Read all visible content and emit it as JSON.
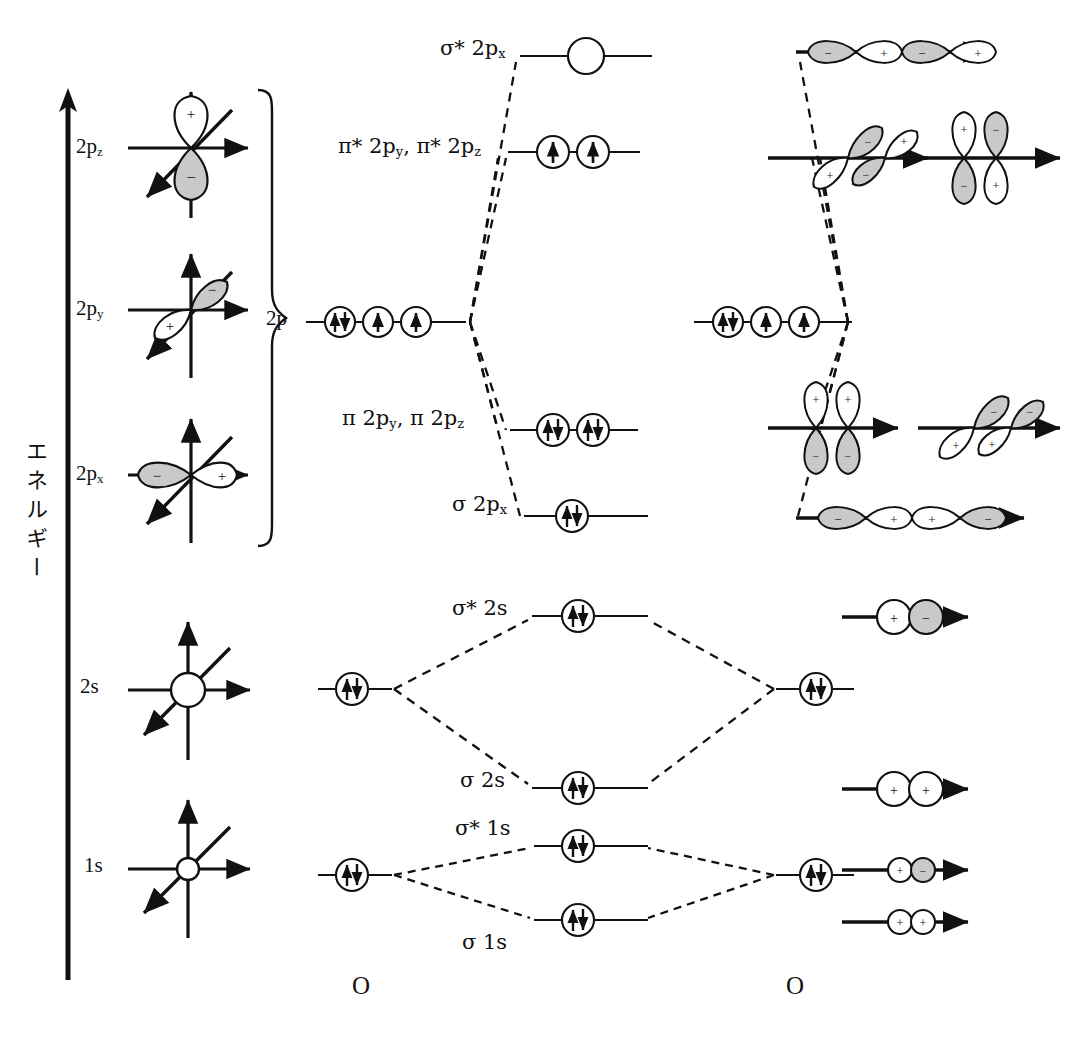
{
  "diagram": {
    "title_axis": "エネルギー",
    "molecule": "O2",
    "atom_left_label": "O",
    "atom_right_label": "O"
  },
  "atomic_orbitals": [
    {
      "name": "2p-z-orbital",
      "label_main": "2p",
      "label_sub": "z",
      "lobes": [
        {
          "sign": "+",
          "shade": "white"
        },
        {
          "sign": "-",
          "shade": "gray"
        }
      ],
      "orientation": "vertical"
    },
    {
      "name": "2p-y-orbital",
      "label_main": "2p",
      "label_sub": "y",
      "lobes": [
        {
          "sign": "-",
          "shade": "gray"
        },
        {
          "sign": "+",
          "shade": "white"
        }
      ],
      "orientation": "diagonal"
    },
    {
      "name": "2p-x-orbital",
      "label_main": "2p",
      "label_sub": "x",
      "lobes": [
        {
          "sign": "-",
          "shade": "gray"
        },
        {
          "sign": "+",
          "shade": "white"
        }
      ],
      "orientation": "horizontal"
    },
    {
      "name": "2s-orbital",
      "label_main": "2s",
      "label_sub": "",
      "lobes": [],
      "orientation": "sphere"
    },
    {
      "name": "1s-orbital",
      "label_main": "1s",
      "label_sub": "",
      "lobes": [],
      "orientation": "sphere"
    }
  ],
  "atom_levels": [
    {
      "key": "2p",
      "label_main": "2p",
      "label_sub": "",
      "boxes": [
        "pair",
        "up",
        "up"
      ],
      "brace": true
    },
    {
      "key": "2s",
      "label_main": "2s",
      "label_sub": "",
      "boxes": [
        "pair"
      ],
      "brace": false
    },
    {
      "key": "1s",
      "label_main": "1s",
      "label_sub": "",
      "boxes": [
        "pair"
      ],
      "brace": false
    }
  ],
  "molecular_orbitals": [
    {
      "name": "sigma-star-2px",
      "label": "σ* 2p",
      "sub": "x",
      "occupancy": [
        "empty"
      ],
      "count": 1
    },
    {
      "name": "pi-star-2py-2pz",
      "label": "π* 2p",
      "sub": "y",
      "label_full": "π* 2p_y, π* 2p_z",
      "occupancy": [
        "up",
        "up"
      ],
      "count": 2
    },
    {
      "name": "pi-2py-2pz",
      "label": "π 2p",
      "sub": "y",
      "label_full": "π 2p_y, π 2p_z",
      "occupancy": [
        "pair",
        "pair"
      ],
      "count": 2
    },
    {
      "name": "sigma-2px",
      "label": "σ 2p",
      "sub": "x",
      "occupancy": [
        "pair"
      ],
      "count": 1
    },
    {
      "name": "sigma-star-2s",
      "label": "σ* 2s",
      "sub": "",
      "occupancy": [
        "pair"
      ],
      "count": 1
    },
    {
      "name": "sigma-2s",
      "label": "σ 2s",
      "sub": "",
      "occupancy": [
        "pair"
      ],
      "count": 1
    },
    {
      "name": "sigma-star-1s",
      "label": "σ* 1s",
      "sub": "",
      "occupancy": [
        "pair"
      ],
      "count": 1
    },
    {
      "name": "sigma-1s",
      "label": "σ 1s",
      "sub": "",
      "occupancy": [
        "pair"
      ],
      "count": 1
    }
  ],
  "mo_labels": {
    "sigma_star_2px": "σ* 2p",
    "sigma_star_2px_sub": "x",
    "pi_star_a": "π* 2p",
    "pi_star_a_sub": "y",
    "pi_star_b": ", π* 2p",
    "pi_star_b_sub": "z",
    "pi_a": "π 2p",
    "pi_a_sub": "y",
    "pi_b": ", π 2p",
    "pi_b_sub": "z",
    "sigma_2px": "σ 2p",
    "sigma_2px_sub": "x",
    "sigma_star_2s": "σ* 2s",
    "sigma_2s": "σ 2s",
    "sigma_star_1s": "σ* 1s",
    "sigma_1s": "σ 1s"
  },
  "overlap_pictures": [
    {
      "name": "sigma-star-2px-overlap",
      "type": "p-sigma-4lobe",
      "signs": [
        "-",
        "+",
        "-",
        "+"
      ],
      "shades": [
        "gray",
        "white",
        "gray",
        "white"
      ]
    },
    {
      "name": "pi-star-2py-overlap",
      "type": "p-pi-diagonal",
      "signs": [
        "-",
        "+",
        "+",
        "-"
      ],
      "shades": [
        "gray",
        "white",
        "white",
        "gray"
      ]
    },
    {
      "name": "pi-star-2pz-overlap",
      "type": "p-pi-vertical",
      "signs": [
        "+",
        "-",
        "-",
        "+"
      ],
      "shades": [
        "white",
        "gray",
        "gray",
        "white"
      ]
    },
    {
      "name": "pi-2pz-overlap",
      "type": "p-pi-vertical",
      "signs": [
        "+",
        "+",
        "-",
        "-"
      ],
      "shades": [
        "white",
        "white",
        "gray",
        "gray"
      ]
    },
    {
      "name": "pi-2py-overlap",
      "type": "p-pi-diagonal",
      "signs": [
        "-",
        "-",
        "+",
        "+"
      ],
      "shades": [
        "gray",
        "gray",
        "white",
        "white"
      ]
    },
    {
      "name": "sigma-2px-overlap",
      "type": "p-sigma-4lobe",
      "signs": [
        "-",
        "+",
        "+",
        "-"
      ],
      "shades": [
        "gray",
        "white",
        "white",
        "gray"
      ]
    },
    {
      "name": "sigma-star-2s-overlap",
      "type": "s-pair-large",
      "signs": [
        "+",
        "-"
      ],
      "shades": [
        "white",
        "gray"
      ]
    },
    {
      "name": "sigma-2s-overlap",
      "type": "s-pair-large",
      "signs": [
        "+",
        "+"
      ],
      "shades": [
        "white",
        "white"
      ]
    },
    {
      "name": "sigma-star-1s-overlap",
      "type": "s-pair-small",
      "signs": [
        "+",
        "-"
      ],
      "shades": [
        "white",
        "gray"
      ]
    },
    {
      "name": "sigma-1s-overlap",
      "type": "s-pair-small",
      "signs": [
        "+",
        "+"
      ],
      "shades": [
        "white",
        "white"
      ]
    }
  ],
  "colors": {
    "ink": "#111111",
    "shade_fill": "#c9c9c9",
    "white_fill": "#ffffff",
    "background": "#ffffff"
  }
}
